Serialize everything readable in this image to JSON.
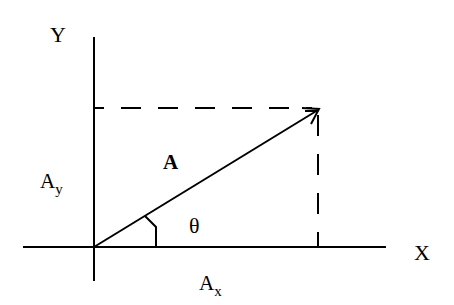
{
  "diagram": {
    "labels": {
      "y_axis": "Y",
      "x_axis": "X",
      "vector": "A",
      "y_component_base": "A",
      "y_component_sub": "y",
      "x_component_base": "A",
      "x_component_sub": "x",
      "angle": "θ"
    },
    "colors": {
      "stroke": "#000000",
      "background": "#ffffff"
    },
    "geometry": {
      "origin": [
        94,
        247
      ],
      "y_axis": {
        "from": [
          94,
          37
        ],
        "to": [
          94,
          281
        ]
      },
      "x_axis": {
        "from": [
          23,
          247
        ],
        "to": [
          386,
          247
        ]
      },
      "vector_tip": [
        319,
        109
      ],
      "dashed_horizontal": {
        "from": [
          94,
          108
        ],
        "to": [
          319,
          108
        ]
      },
      "dashed_vertical": {
        "from": [
          318,
          110
        ],
        "to": [
          318,
          247
        ]
      }
    }
  }
}
